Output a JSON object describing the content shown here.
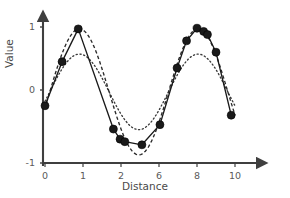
{
  "chart_data": {
    "type": "line",
    "title": "",
    "subtitle": "",
    "xlabel": "Distance",
    "ylabel": "Value",
    "xlim": [
      0,
      10
    ],
    "ylim": [
      -1,
      1
    ],
    "grid": false,
    "legend": "none",
    "x_tick_labels": [
      "0",
      "1",
      "2",
      "6",
      "8",
      "10"
    ],
    "x_tick_positions": [
      0,
      1,
      2,
      6,
      8,
      10
    ],
    "y_tick_labels": [
      "1",
      "0",
      "-1"
    ],
    "y_tick_positions": [
      1,
      0,
      -1
    ],
    "series": [
      {
        "name": "observed-data-points",
        "style": "solid line with filled circle markers",
        "color": "#1a1a1a",
        "points": [
          {
            "x": 0.0,
            "y": -0.25
          },
          {
            "x": 0.9,
            "y": 0.45
          },
          {
            "x": 1.75,
            "y": 0.97
          },
          {
            "x": 3.6,
            "y": -0.62
          },
          {
            "x": 3.95,
            "y": -0.78
          },
          {
            "x": 4.2,
            "y": -0.82
          },
          {
            "x": 5.1,
            "y": -0.87
          },
          {
            "x": 6.05,
            "y": -0.55
          },
          {
            "x": 6.95,
            "y": 0.35
          },
          {
            "x": 7.45,
            "y": 0.78
          },
          {
            "x": 8.0,
            "y": 0.98
          },
          {
            "x": 8.35,
            "y": 0.93
          },
          {
            "x": 8.55,
            "y": 0.88
          },
          {
            "x": 9.0,
            "y": 0.6
          },
          {
            "x": 9.8,
            "y": -0.4
          }
        ]
      },
      {
        "name": "close-fit-curve",
        "style": "dashed",
        "color": "#2b2b2b",
        "amplitude": 1.0,
        "description": "dashed sinusoid closely tracking the data peaks and trough"
      },
      {
        "name": "smooth-fit-curve",
        "style": "dotted",
        "color": "#3a3a3a",
        "amplitude": 0.6,
        "description": "dotted smooth sinusoid of reduced amplitude"
      }
    ]
  },
  "axes": {
    "x_title": "Distance",
    "y_title": "Value",
    "x_ticks": [
      {
        "label": "0",
        "px": 45
      },
      {
        "label": "1",
        "px": 83
      },
      {
        "label": "2",
        "px": 121
      },
      {
        "label": "6",
        "px": 159
      },
      {
        "label": "8",
        "px": 197
      },
      {
        "label": "10",
        "px": 235
      }
    ],
    "y_ticks": [
      {
        "label": "1",
        "px": 27
      },
      {
        "label": "0",
        "px": 90
      },
      {
        "label": "-1",
        "px": 163
      }
    ],
    "axis_color": "#3f3f3f"
  }
}
